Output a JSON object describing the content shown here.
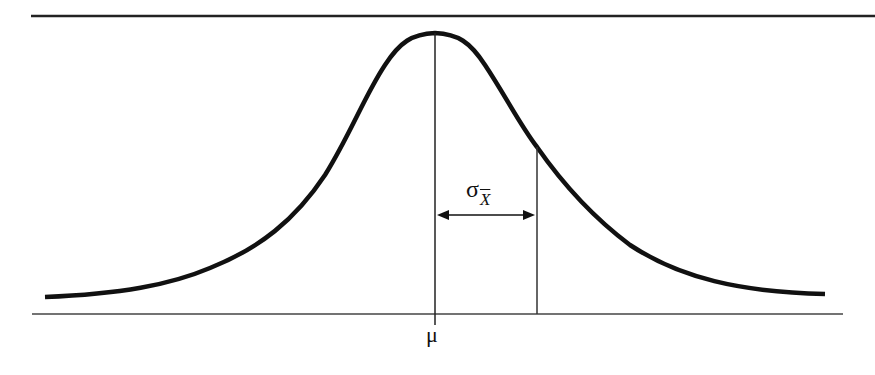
{
  "diagram": {
    "type": "normal-distribution-sampling",
    "labels": {
      "mean": "μ",
      "std_error_symbol": "σ",
      "std_error_subscript": "X"
    },
    "colors": {
      "curve": "#111111",
      "lines": "#333333",
      "background": "#ffffff"
    },
    "elements": {
      "top_border": "horizontal line",
      "baseline": "horizontal axis",
      "mean_line": "vertical line at μ",
      "sd_line": "vertical line at μ + σ",
      "arrow": "double-headed arrow spanning one standard error"
    }
  }
}
